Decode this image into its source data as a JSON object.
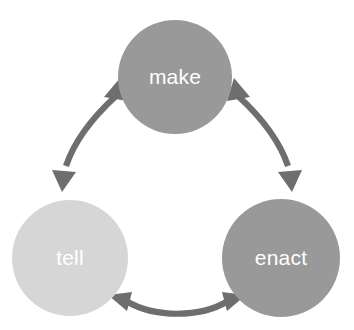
{
  "diagram": {
    "background_color": "#ffffff",
    "arrow_color": "#6e6e6e",
    "label_color": "#ffffff",
    "nodes": [
      {
        "id": "make",
        "label": "make",
        "color": "#999999",
        "cx": 175,
        "cy": 77,
        "r": 57
      },
      {
        "id": "tell",
        "label": "tell",
        "color": "#d6d6d6",
        "cx": 70,
        "cy": 258,
        "r": 58
      },
      {
        "id": "enact",
        "label": "enact",
        "color": "#999999",
        "cx": 281,
        "cy": 258,
        "r": 59
      }
    ],
    "connectors": [
      {
        "id": "make-tell",
        "from": "make",
        "to": "tell",
        "style": "curved-double-headed-arrow"
      },
      {
        "id": "make-enact",
        "from": "make",
        "to": "enact",
        "style": "curved-double-headed-arrow"
      },
      {
        "id": "tell-enact",
        "from": "tell",
        "to": "enact",
        "style": "curved-double-headed-arrow"
      }
    ]
  }
}
